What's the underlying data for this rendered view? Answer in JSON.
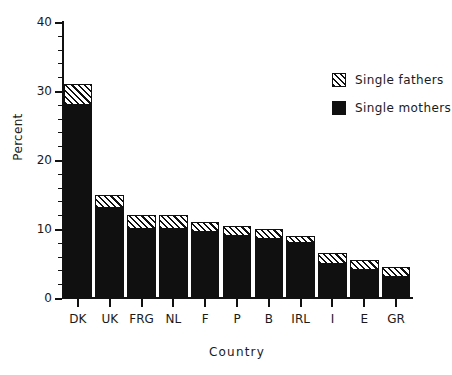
{
  "chart_data": {
    "type": "bar",
    "stacked": true,
    "title": "",
    "xlabel": "Country",
    "ylabel": "Percent",
    "ylim": [
      0,
      40
    ],
    "yticks": [
      0,
      10,
      20,
      30,
      40
    ],
    "ytick_labels": [
      "0",
      "10",
      "20",
      "30",
      "40"
    ],
    "yminor_step": 2,
    "grid": false,
    "legend_position": "upper right",
    "categories": [
      "DK",
      "UK",
      "FRG",
      "NL",
      "F",
      "P",
      "B",
      "IRL",
      "I",
      "E",
      "GR"
    ],
    "series": [
      {
        "name": "Single mothers",
        "color": "#101010",
        "fill": "solid",
        "values": [
          28.0,
          13.0,
          10.0,
          10.0,
          9.5,
          9.0,
          8.5,
          8.0,
          5.0,
          4.0,
          3.0
        ]
      },
      {
        "name": "Single fathers",
        "color": "#101010",
        "fill": "hatched",
        "values": [
          3.0,
          2.0,
          2.0,
          2.0,
          1.5,
          1.5,
          1.5,
          1.0,
          1.5,
          1.5,
          1.5
        ]
      }
    ],
    "totals": [
      31.0,
      15.0,
      12.0,
      12.0,
      11.0,
      10.5,
      10.0,
      9.0,
      6.5,
      5.5,
      4.5
    ]
  },
  "legend": {
    "items": [
      {
        "label": "Single fathers",
        "swatch": "hatched-swatch"
      },
      {
        "label": "Single mothers",
        "swatch": "solid-swatch"
      }
    ]
  }
}
